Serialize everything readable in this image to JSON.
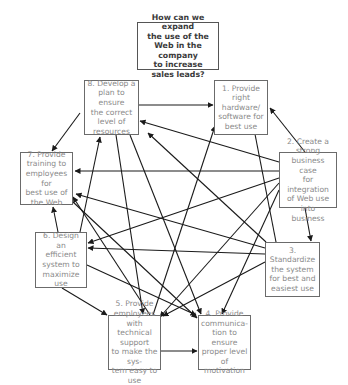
{
  "diagram": {
    "title": "How can we expand\nthe use of the\nWeb in the company\nto increase\nsales leads?",
    "nodes": [
      {
        "id": "q",
        "label": "How can we expand\nthe use of the\nWeb in the company\nto increase\nsales leads?",
        "box": [
          137,
          22,
          82,
          48
        ]
      },
      {
        "id": "1",
        "label": "1. Provide right\nhardware/\nsoftware for\nbest use",
        "box": [
          214,
          80,
          54,
          55
        ]
      },
      {
        "id": "2",
        "label": "2. Create a\nstrong\nbusiness case\nfor integration\nof Web use into\nbusiness",
        "box": [
          279,
          152,
          58,
          56
        ]
      },
      {
        "id": "3",
        "label": "3. Standardize\nthe system\nfor best and\neasiest use",
        "box": [
          265,
          242,
          55,
          55
        ]
      },
      {
        "id": "4",
        "label": "4. Provide\ncommunica-\ntion to ensure\nproper level of\nmotivation",
        "box": [
          198,
          315,
          53,
          55
        ]
      },
      {
        "id": "5",
        "label": "5. Provide\nemployees with\ntechnical support\nto make the sys-\ntem easy to use",
        "box": [
          108,
          315,
          53,
          55
        ]
      },
      {
        "id": "6",
        "label": "6. Design an\nefficient\nsystem to\nmaximize use",
        "box": [
          35,
          232,
          52,
          56
        ]
      },
      {
        "id": "7",
        "label": "7. Provide\ntraining to\nemployees for\nbest use of\nthe Web",
        "box": [
          20,
          152,
          53,
          53
        ]
      },
      {
        "id": "8",
        "label": "8. Develop a\nplan to ensure\nthe correct\nlevel of\nresources",
        "box": [
          84,
          80,
          55,
          55
        ]
      }
    ],
    "edges": [
      {
        "from": "8",
        "to": "1",
        "line": [
          139,
          105,
          213,
          105
        ]
      },
      {
        "from": "8",
        "to": "7",
        "line": [
          80,
          113,
          52,
          151
        ]
      },
      {
        "from": "8",
        "to": "5",
        "line": [
          116,
          135,
          143,
          314
        ]
      },
      {
        "from": "8",
        "to": "4",
        "line": [
          130,
          135,
          201,
          314
        ]
      },
      {
        "from": "2",
        "to": "1",
        "line": [
          305,
          152,
          270,
          108
        ]
      },
      {
        "from": "2",
        "to": "8",
        "line": [
          279,
          162,
          140,
          121
        ]
      },
      {
        "from": "2",
        "to": "7",
        "line": [
          279,
          171,
          75,
          171
        ]
      },
      {
        "from": "2",
        "to": "6",
        "line": [
          279,
          178,
          88,
          243
        ]
      },
      {
        "from": "2",
        "to": "5",
        "line": [
          279,
          183,
          160,
          317
        ]
      },
      {
        "from": "2",
        "to": "4",
        "line": [
          279,
          190,
          222,
          314
        ]
      },
      {
        "from": "2",
        "to": "3",
        "line": [
          305,
          208,
          311,
          241
        ]
      },
      {
        "from": "3",
        "to": "1",
        "line": [
          276,
          242,
          254,
          129
        ]
      },
      {
        "from": "3",
        "to": "8",
        "line": [
          266,
          242,
          148,
          133
        ]
      },
      {
        "from": "3",
        "to": "7",
        "line": [
          265,
          248,
          76,
          194
        ]
      },
      {
        "from": "3",
        "to": "6",
        "line": [
          265,
          254,
          88,
          248
        ]
      },
      {
        "from": "3",
        "to": "5",
        "line": [
          265,
          262,
          163,
          316
        ]
      },
      {
        "from": "6",
        "to": "7",
        "line": [
          58,
          232,
          53,
          207
        ]
      },
      {
        "from": "6",
        "to": "8",
        "line": [
          80,
          232,
          100,
          137
        ]
      },
      {
        "from": "6",
        "to": "5",
        "line": [
          62,
          288,
          107,
          315
        ]
      },
      {
        "from": "6",
        "to": "4",
        "line": [
          87,
          265,
          196,
          315
        ]
      },
      {
        "from": "5",
        "to": "1",
        "line": [
          153,
          315,
          215,
          126
        ]
      },
      {
        "from": "5",
        "to": "7",
        "line": [
          150,
          315,
          73,
          197
        ]
      },
      {
        "from": "5",
        "to": "4",
        "line": [
          161,
          351,
          197,
          351
        ]
      },
      {
        "from": "7",
        "to": "4",
        "line": [
          73,
          202,
          197,
          318
        ]
      }
    ],
    "colors": {
      "edge": "#1a1a1a",
      "node_border": "#6b6b6b",
      "node_text": "#8a8a8a",
      "question_text": "#3a3a3a"
    }
  }
}
